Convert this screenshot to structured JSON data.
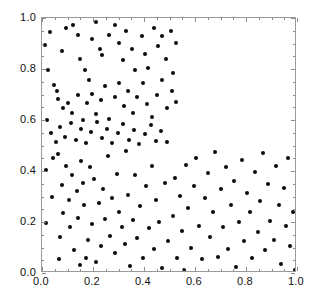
{
  "chart_data": {
    "type": "scatter",
    "title": "",
    "xlabel": "",
    "ylabel": "",
    "xlim": [
      0.0,
      1.0
    ],
    "ylim": [
      0.0,
      1.0
    ],
    "grid": false,
    "legend": null,
    "marker": {
      "shape": "circle",
      "color": "#0a0a0a",
      "size_px": 4
    },
    "frame_color": "#9a9a9a",
    "xticks": [
      {
        "value": 0.0,
        "label": "0.0"
      },
      {
        "value": 0.2,
        "label": "0.2"
      },
      {
        "value": 0.4,
        "label": "0.4"
      },
      {
        "value": 0.6,
        "label": "0.6"
      },
      {
        "value": 0.8,
        "label": "0.8"
      },
      {
        "value": 1.0,
        "label": "1.0"
      }
    ],
    "yticks": [
      {
        "value": 0.0,
        "label": "0.0"
      },
      {
        "value": 0.2,
        "label": "0.2"
      },
      {
        "value": 0.4,
        "label": "0.4"
      },
      {
        "value": 0.6,
        "label": "0.6"
      },
      {
        "value": 0.8,
        "label": "0.8"
      },
      {
        "value": 1.0,
        "label": "1.0"
      }
    ],
    "xminor_step": 0.05,
    "yminor_step": 0.05,
    "annotation": "Uniform random points over the unit square with the upper-right region (x>0.53, y>0.52) empty",
    "n_points": 151,
    "points": [
      [
        0.01,
        0.893
      ],
      [
        0.03,
        0.946
      ],
      [
        0.022,
        0.797
      ],
      [
        0.018,
        0.601
      ],
      [
        0.046,
        0.739
      ],
      [
        0.06,
        0.714
      ],
      [
        0.078,
        0.869
      ],
      [
        0.096,
        0.962
      ],
      [
        0.121,
        0.973
      ],
      [
        0.14,
        0.935
      ],
      [
        0.15,
        0.84
      ],
      [
        0.17,
        0.796
      ],
      [
        0.186,
        0.758
      ],
      [
        0.196,
        0.917
      ],
      [
        0.213,
        0.985
      ],
      [
        0.228,
        0.879
      ],
      [
        0.235,
        0.855
      ],
      [
        0.262,
        0.933
      ],
      [
        0.285,
        0.971
      ],
      [
        0.3,
        0.902
      ],
      [
        0.318,
        0.836
      ],
      [
        0.33,
        0.949
      ],
      [
        0.352,
        0.879
      ],
      [
        0.366,
        0.795
      ],
      [
        0.392,
        0.931
      ],
      [
        0.404,
        0.858
      ],
      [
        0.416,
        0.805
      ],
      [
        0.438,
        0.962
      ],
      [
        0.455,
        0.889
      ],
      [
        0.47,
        0.93
      ],
      [
        0.487,
        0.838
      ],
      [
        0.506,
        0.948
      ],
      [
        0.524,
        0.901
      ],
      [
        0.062,
        0.683
      ],
      [
        0.083,
        0.646
      ],
      [
        0.1,
        0.668
      ],
      [
        0.118,
        0.627
      ],
      [
        0.14,
        0.697
      ],
      [
        0.16,
        0.6
      ],
      [
        0.176,
        0.666
      ],
      [
        0.198,
        0.703
      ],
      [
        0.212,
        0.622
      ],
      [
        0.231,
        0.678
      ],
      [
        0.248,
        0.735
      ],
      [
        0.264,
        0.603
      ],
      [
        0.286,
        0.69
      ],
      [
        0.302,
        0.745
      ],
      [
        0.32,
        0.655
      ],
      [
        0.338,
        0.712
      ],
      [
        0.356,
        0.628
      ],
      [
        0.374,
        0.69
      ],
      [
        0.396,
        0.744
      ],
      [
        0.412,
        0.664
      ],
      [
        0.432,
        0.612
      ],
      [
        0.452,
        0.7
      ],
      [
        0.47,
        0.755
      ],
      [
        0.492,
        0.648
      ],
      [
        0.508,
        0.712
      ],
      [
        0.524,
        0.67
      ],
      [
        0.514,
        0.785
      ],
      [
        0.036,
        0.548
      ],
      [
        0.055,
        0.512
      ],
      [
        0.072,
        0.572
      ],
      [
        0.092,
        0.535
      ],
      [
        0.112,
        0.588
      ],
      [
        0.133,
        0.52
      ],
      [
        0.152,
        0.563
      ],
      [
        0.172,
        0.508
      ],
      [
        0.192,
        0.552
      ],
      [
        0.214,
        0.591
      ],
      [
        0.234,
        0.528
      ],
      [
        0.256,
        0.566
      ],
      [
        0.276,
        0.51
      ],
      [
        0.298,
        0.548
      ],
      [
        0.318,
        0.584
      ],
      [
        0.34,
        0.523
      ],
      [
        0.36,
        0.56
      ],
      [
        0.382,
        0.505
      ],
      [
        0.404,
        0.546
      ],
      [
        0.426,
        0.58
      ],
      [
        0.446,
        0.519
      ],
      [
        0.468,
        0.556
      ],
      [
        0.49,
        0.512
      ],
      [
        0.015,
        0.404
      ],
      [
        0.016,
        0.198
      ],
      [
        0.04,
        0.3
      ],
      [
        0.042,
        0.452
      ],
      [
        0.062,
        0.465
      ],
      [
        0.068,
        0.055
      ],
      [
        0.07,
        0.14
      ],
      [
        0.078,
        0.346
      ],
      [
        0.082,
        0.234
      ],
      [
        0.095,
        0.42
      ],
      [
        0.104,
        0.286
      ],
      [
        0.11,
        0.18
      ],
      [
        0.118,
        0.383
      ],
      [
        0.125,
        0.09
      ],
      [
        0.136,
        0.32
      ],
      [
        0.142,
        0.215
      ],
      [
        0.148,
        0.032
      ],
      [
        0.152,
        0.44
      ],
      [
        0.16,
        0.352
      ],
      [
        0.166,
        0.268
      ],
      [
        0.172,
        0.06
      ],
      [
        0.18,
        0.13
      ],
      [
        0.19,
        0.414
      ],
      [
        0.196,
        0.192
      ],
      [
        0.204,
        0.368
      ],
      [
        0.21,
        0.044
      ],
      [
        0.222,
        0.276
      ],
      [
        0.232,
        0.106
      ],
      [
        0.24,
        0.33
      ],
      [
        0.248,
        0.21
      ],
      [
        0.258,
        0.458
      ],
      [
        0.266,
        0.146
      ],
      [
        0.276,
        0.296
      ],
      [
        0.286,
        0.078
      ],
      [
        0.294,
        0.39
      ],
      [
        0.302,
        0.24
      ],
      [
        0.314,
        0.18
      ],
      [
        0.324,
        0.112
      ],
      [
        0.33,
        0.48
      ],
      [
        0.338,
        0.306
      ],
      [
        0.346,
        0.026
      ],
      [
        0.356,
        0.208
      ],
      [
        0.364,
        0.386
      ],
      [
        0.374,
        0.138
      ],
      [
        0.384,
        0.262
      ],
      [
        0.396,
        0.06
      ],
      [
        0.406,
        0.34
      ],
      [
        0.418,
        0.176
      ],
      [
        0.43,
        0.42
      ],
      [
        0.438,
        0.096
      ],
      [
        0.448,
        0.286
      ],
      [
        0.46,
        0.2
      ],
      [
        0.47,
        0.018
      ],
      [
        0.482,
        0.352
      ],
      [
        0.494,
        0.126
      ],
      [
        0.512,
        0.222
      ],
      [
        0.52,
        0.372
      ],
      [
        0.528,
        0.06
      ],
      [
        0.54,
        0.302
      ],
      [
        0.548,
        0.166
      ],
      [
        0.556,
        0.012
      ],
      [
        0.566,
        0.424
      ],
      [
        0.574,
        0.256
      ],
      [
        0.586,
        0.098
      ],
      [
        0.596,
        0.34
      ],
      [
        0.604,
        0.452
      ],
      [
        0.616,
        0.186
      ],
      [
        0.628,
        0.056
      ],
      [
        0.638,
        0.296
      ],
      [
        0.65,
        0.392
      ],
      [
        0.66,
        0.14
      ],
      [
        0.672,
        0.24
      ],
      [
        0.68,
        0.476
      ],
      [
        0.69,
        0.062
      ],
      [
        0.7,
        0.328
      ],
      [
        0.71,
        0.182
      ],
      [
        0.722,
        0.414
      ],
      [
        0.73,
        0.096
      ],
      [
        0.742,
        0.268
      ],
      [
        0.752,
        0.36
      ],
      [
        0.76,
        0.022
      ],
      [
        0.772,
        0.2
      ],
      [
        0.784,
        0.442
      ],
      [
        0.792,
        0.124
      ],
      [
        0.804,
        0.312
      ],
      [
        0.816,
        0.238
      ],
      [
        0.824,
        0.058
      ],
      [
        0.836,
        0.396
      ],
      [
        0.846,
        0.16
      ],
      [
        0.856,
        0.282
      ],
      [
        0.866,
        0.47
      ],
      [
        0.876,
        0.092
      ],
      [
        0.886,
        0.348
      ],
      [
        0.896,
        0.204
      ],
      [
        0.908,
        0.13
      ],
      [
        0.918,
        0.418
      ],
      [
        0.928,
        0.268
      ],
      [
        0.938,
        0.036
      ],
      [
        0.948,
        0.332
      ],
      [
        0.958,
        0.186
      ],
      [
        0.966,
        0.452
      ],
      [
        0.974,
        0.104
      ],
      [
        0.984,
        0.24
      ],
      [
        0.992,
        0.01
      ]
    ]
  }
}
